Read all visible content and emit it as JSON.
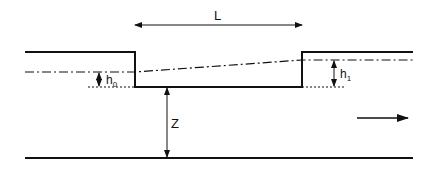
{
  "diagram": {
    "type": "hydraulic channel step / weir section",
    "labels": {
      "length": "L",
      "upstream_depth": "h",
      "upstream_depth_sub": "0",
      "downstream_depth": "h",
      "downstream_depth_sub": "1",
      "height": "Z"
    },
    "flow_direction": "right",
    "colors": {
      "stroke": "#111111",
      "background": "#ffffff"
    }
  }
}
